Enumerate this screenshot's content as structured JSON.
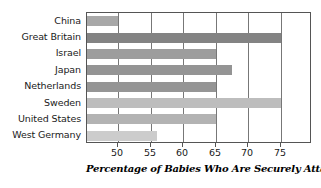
{
  "chart_data": {
    "type": "bar",
    "orientation": "horizontal",
    "title": "",
    "caption": "Percentage of Babies Who Are Securely Attached",
    "xlabel": "",
    "ylabel": "",
    "categories": [
      "China",
      "Great Britain",
      "Israel",
      "Japan",
      "Netherlands",
      "Sweden",
      "United States",
      "West Germany"
    ],
    "values": [
      50,
      75,
      65,
      67.5,
      65,
      75,
      65,
      56
    ],
    "xlim": [
      45.2,
      79.8
    ],
    "xticks": [
      50,
      55,
      60,
      65,
      70,
      75
    ],
    "xtick_labels": [
      "50",
      "55",
      "60",
      "65",
      "70",
      "75"
    ],
    "grid": true,
    "grid_axis": "x",
    "legend": "none",
    "bar_colors": [
      "#a8a8a8",
      "#838383",
      "#9d9d9d",
      "#949494",
      "#959595",
      "#bdbdbd",
      "#b3b3b3",
      "#cccccc"
    ]
  },
  "axis": {
    "frame_color": "#555555",
    "gridline_color": "#777777"
  }
}
